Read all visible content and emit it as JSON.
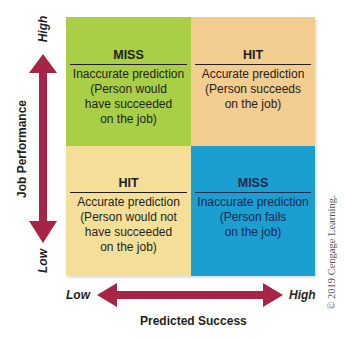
{
  "colors": {
    "green": "#a8cf45",
    "tan": "#f3cd8f",
    "pale_yellow": "#f5df98",
    "blue": "#1b9ed0",
    "arrow": "#a72347"
  },
  "quadrants": {
    "top_left": {
      "title": "MISS",
      "lines": [
        "Inaccurate prediction",
        "(Person would",
        "have succeeded",
        "on the job)"
      ]
    },
    "top_right": {
      "title": "HIT",
      "lines": [
        "Accurate prediction",
        "(Person succeeds",
        "on the job)"
      ]
    },
    "bottom_left": {
      "title": "HIT",
      "lines": [
        "Accurate prediction",
        "(Person would not",
        "have succeeded",
        "on the job)"
      ]
    },
    "bottom_right": {
      "title": "MISS",
      "lines": [
        "Inaccurate prediction",
        "(Person fails",
        "on the job)"
      ]
    }
  },
  "y_axis": {
    "label": "Job Performance",
    "high": "High",
    "low": "Low"
  },
  "x_axis": {
    "label": "Predicted Success",
    "high": "High",
    "low": "Low"
  },
  "copyright": "© 2019 Cengage Learning."
}
